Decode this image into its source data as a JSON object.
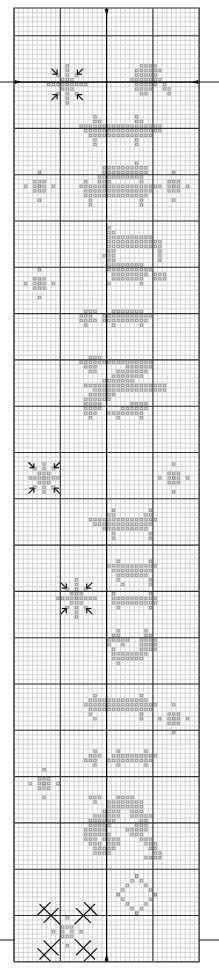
{
  "chart": {
    "type": "cross-stitch-pattern",
    "origin_px": [
      14,
      8
    ],
    "cell_px": 4.63,
    "cols": 40,
    "rows": 206,
    "major_every": 10,
    "center_col": 20,
    "center_row": 103,
    "major_row_offset": 6,
    "colors": {
      "background": "#ffffff",
      "minor_line": "#b8b8b8",
      "major_line": "#333333",
      "stitch": "#8c8c8c",
      "stitch_dark": "#6e6e6e",
      "backstitch": "#111111",
      "border": "#555555"
    },
    "center_markers": [
      "top-arrow",
      "bottom-arrow",
      "left-arrow",
      "right-arrow"
    ],
    "motifs": [
      {
        "name": "snowflake-1",
        "kind": "snowflake-arrows",
        "cx": 11,
        "cy": 16,
        "r": 4
      },
      {
        "name": "corner-blob-top",
        "runs": [
          [
            12,
            27,
            30
          ],
          [
            13,
            26,
            31
          ],
          [
            14,
            26,
            30
          ],
          [
            15,
            25,
            31
          ],
          [
            16,
            26,
            30
          ],
          [
            17,
            26,
            29
          ],
          [
            18,
            27,
            28
          ],
          [
            16,
            32,
            32
          ],
          [
            17,
            32,
            33
          ],
          [
            18,
            33,
            33
          ]
        ]
      },
      {
        "name": "letter-row-1",
        "runs": [
          [
            23,
            17,
            17
          ],
          [
            23,
            26,
            26
          ],
          [
            24,
            17,
            18
          ],
          [
            24,
            26,
            27
          ],
          [
            25,
            14,
            31
          ],
          [
            26,
            15,
            31
          ],
          [
            27,
            16,
            29
          ],
          [
            28,
            17,
            17
          ],
          [
            28,
            26,
            26
          ],
          [
            29,
            17,
            17
          ],
          [
            29,
            26,
            26
          ]
        ]
      },
      {
        "name": "letter-row-2",
        "runs": [
          [
            33,
            26,
            26
          ],
          [
            34,
            19,
            28
          ],
          [
            35,
            19,
            28
          ],
          [
            36,
            18,
            27
          ],
          [
            37,
            18,
            20
          ],
          [
            38,
            19,
            19
          ]
        ]
      },
      {
        "name": "small-flake-l1",
        "kind": "cross",
        "cx": 5,
        "cy": 38,
        "r": 3
      },
      {
        "name": "small-flake-r1",
        "kind": "cross",
        "cx": 34,
        "cy": 38,
        "r": 3
      },
      {
        "name": "letter-row-3",
        "runs": [
          [
            37,
            15,
            15
          ],
          [
            37,
            27,
            27
          ],
          [
            38,
            14,
            30
          ],
          [
            39,
            15,
            29
          ],
          [
            40,
            15,
            28
          ],
          [
            41,
            16,
            16
          ],
          [
            41,
            27,
            27
          ],
          [
            42,
            16,
            16
          ],
          [
            42,
            27,
            27
          ]
        ]
      },
      {
        "name": "letter-row-4",
        "runs": [
          [
            47,
            20,
            20
          ],
          [
            48,
            20,
            21
          ],
          [
            49,
            20,
            29
          ],
          [
            50,
            20,
            31
          ],
          [
            51,
            20,
            31
          ],
          [
            52,
            20,
            21
          ],
          [
            52,
            31,
            31
          ],
          [
            53,
            19,
            21
          ],
          [
            53,
            31,
            31
          ],
          [
            54,
            20,
            21
          ],
          [
            54,
            31,
            31
          ],
          [
            55,
            20,
            27
          ],
          [
            56,
            20,
            29
          ],
          [
            57,
            21,
            28
          ],
          [
            57,
            30,
            32
          ],
          [
            58,
            21,
            27
          ],
          [
            58,
            30,
            32
          ],
          [
            59,
            20,
            20
          ],
          [
            59,
            27,
            27
          ]
        ]
      },
      {
        "name": "small-flake-l2",
        "kind": "cross",
        "cx": 5,
        "cy": 59,
        "r": 3
      },
      {
        "name": "letter-row-5",
        "runs": [
          [
            65,
            15,
            17
          ],
          [
            65,
            21,
            27
          ],
          [
            66,
            14,
            16
          ],
          [
            66,
            19,
            29
          ],
          [
            67,
            14,
            17
          ],
          [
            67,
            19,
            28
          ],
          [
            68,
            15,
            15
          ],
          [
            68,
            21,
            21
          ],
          [
            68,
            27,
            27
          ]
        ]
      },
      {
        "name": "letter-row-6",
        "runs": [
          [
            75,
            16,
            18
          ],
          [
            76,
            14,
            29
          ],
          [
            77,
            15,
            17
          ],
          [
            77,
            24,
            29
          ],
          [
            78,
            16,
            17
          ],
          [
            78,
            22,
            28
          ],
          [
            79,
            21,
            27
          ],
          [
            80,
            19,
            25
          ],
          [
            81,
            15,
            32
          ],
          [
            82,
            17,
            32
          ],
          [
            83,
            16,
            21
          ],
          [
            84,
            15,
            20
          ],
          [
            85,
            15,
            18
          ],
          [
            85,
            25,
            28
          ],
          [
            86,
            15,
            18
          ],
          [
            86,
            23,
            28
          ],
          [
            87,
            15,
            17
          ],
          [
            87,
            20,
            27
          ],
          [
            88,
            16,
            16
          ],
          [
            88,
            22,
            22
          ],
          [
            88,
            27,
            27
          ]
        ]
      },
      {
        "name": "snowflake-2",
        "kind": "snowflake-arrows",
        "cx": 6,
        "cy": 101,
        "r": 3
      },
      {
        "name": "small-flake-r2",
        "kind": "cross",
        "cx": 34,
        "cy": 101,
        "r": 3
      },
      {
        "name": "letter-row-7",
        "runs": [
          [
            108,
            21,
            21
          ],
          [
            108,
            29,
            29
          ],
          [
            109,
            20,
            21
          ],
          [
            109,
            28,
            29
          ],
          [
            110,
            16,
            30
          ],
          [
            111,
            17,
            29
          ],
          [
            112,
            19,
            28
          ],
          [
            113,
            21,
            21
          ],
          [
            113,
            29,
            29
          ],
          [
            114,
            21,
            21
          ],
          [
            114,
            29,
            29
          ]
        ]
      },
      {
        "name": "letter-row-8",
        "runs": [
          [
            119,
            22,
            22
          ],
          [
            119,
            29,
            29
          ],
          [
            120,
            20,
            30
          ],
          [
            121,
            21,
            29
          ],
          [
            122,
            22,
            28
          ],
          [
            123,
            22,
            22
          ],
          [
            123,
            29,
            29
          ],
          [
            124,
            23,
            23
          ],
          [
            124,
            29,
            29
          ]
        ]
      },
      {
        "name": "snowflake-3",
        "kind": "snowflake-arrows",
        "cx": 13,
        "cy": 127,
        "r": 4
      },
      {
        "name": "letter-row-9",
        "runs": [
          [
            126,
            21,
            21
          ],
          [
            126,
            29,
            29
          ],
          [
            127,
            21,
            30
          ],
          [
            128,
            21,
            30
          ],
          [
            129,
            22,
            22
          ],
          [
            129,
            29,
            29
          ]
        ]
      },
      {
        "name": "letter-row-10",
        "runs": [
          [
            134,
            22,
            22
          ],
          [
            134,
            28,
            28
          ],
          [
            135,
            21,
            22
          ],
          [
            135,
            28,
            29
          ],
          [
            136,
            20,
            24
          ],
          [
            136,
            27,
            30
          ],
          [
            137,
            20,
            20
          ],
          [
            137,
            23,
            23
          ],
          [
            137,
            27,
            30
          ],
          [
            138,
            21,
            21
          ],
          [
            138,
            27,
            30
          ],
          [
            139,
            21,
            28
          ],
          [
            140,
            21,
            27
          ],
          [
            141,
            22,
            22
          ]
        ]
      },
      {
        "name": "letter-row-11",
        "runs": [
          [
            148,
            17,
            17
          ],
          [
            148,
            27,
            27
          ],
          [
            149,
            16,
            28
          ],
          [
            150,
            15,
            30
          ],
          [
            151,
            16,
            29
          ],
          [
            152,
            16,
            16
          ],
          [
            152,
            27,
            27
          ],
          [
            153,
            17,
            17
          ],
          [
            153,
            27,
            27
          ]
        ]
      },
      {
        "name": "small-flake-r3",
        "kind": "cross",
        "cx": 34,
        "cy": 153,
        "r": 3
      },
      {
        "name": "letter-row-12",
        "runs": [
          [
            160,
            17,
            17
          ],
          [
            160,
            22,
            22
          ],
          [
            160,
            28,
            28
          ],
          [
            161,
            16,
            18
          ],
          [
            161,
            21,
            30
          ],
          [
            162,
            15,
            17
          ],
          [
            162,
            20,
            29
          ],
          [
            163,
            17,
            17
          ],
          [
            163,
            22,
            22
          ],
          [
            163,
            28,
            28
          ]
        ]
      },
      {
        "name": "small-flake-l3",
        "kind": "cross",
        "cx": 6,
        "cy": 167,
        "r": 3
      },
      {
        "name": "letter-row-13",
        "runs": [
          [
            170,
            16,
            18
          ],
          [
            170,
            22,
            25
          ],
          [
            171,
            17,
            17
          ],
          [
            171,
            20,
            27
          ],
          [
            172,
            20,
            27
          ],
          [
            173,
            19,
            22
          ],
          [
            173,
            25,
            27
          ],
          [
            174,
            17,
            22
          ],
          [
            174,
            25,
            29
          ],
          [
            175,
            16,
            21
          ],
          [
            175,
            27,
            28
          ],
          [
            176,
            16,
            20
          ],
          [
            176,
            26,
            28
          ],
          [
            177,
            15,
            19
          ],
          [
            177,
            24,
            28
          ],
          [
            178,
            15,
            20
          ],
          [
            178,
            25,
            27
          ],
          [
            179,
            15,
            17
          ],
          [
            179,
            19,
            22
          ],
          [
            179,
            27,
            29
          ],
          [
            180,
            16,
            18
          ],
          [
            180,
            20,
            22
          ],
          [
            180,
            28,
            30
          ],
          [
            181,
            17,
            21
          ],
          [
            181,
            29,
            30
          ],
          [
            182,
            17,
            20
          ],
          [
            182,
            30,
            31
          ],
          [
            183,
            28,
            31
          ]
        ]
      },
      {
        "name": "small-diamond",
        "kind": "diamond",
        "cx": 26,
        "cy": 191,
        "r": 4
      },
      {
        "name": "snowflake-big",
        "kind": "snowflake-big",
        "cx": 11,
        "cy": 199,
        "r": 3
      }
    ]
  }
}
